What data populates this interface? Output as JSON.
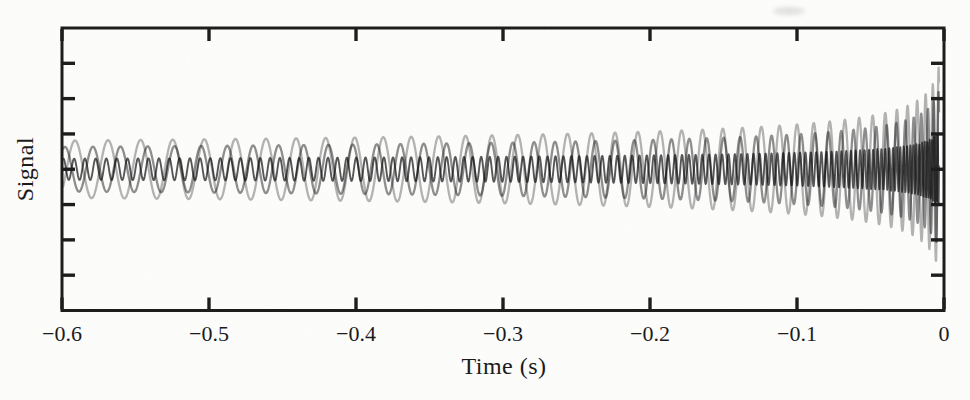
{
  "figure": {
    "background_color": "#fdfdfc",
    "axis_color": "#1a1a1a",
    "text_color": "#1b1b1b"
  },
  "chart_data": {
    "type": "line",
    "title": "",
    "xlabel": "Time (s)",
    "ylabel": "Signal",
    "xlim": [
      -0.6,
      0
    ],
    "x_ticks": [
      -0.6,
      -0.5,
      -0.4,
      -0.3,
      -0.2,
      -0.1,
      0
    ],
    "x_tick_labels": [
      "−0.6",
      "−0.5",
      "−0.4",
      "−0.3",
      "−0.2",
      "−0.1",
      "0"
    ],
    "y_tick_count": 7,
    "y_tick_labels": [],
    "grid": false,
    "legend": false,
    "model": {
      "frequency_law": "f(tau) = f_ref * (tau / 0.5 s)^(-3/8), tau = time before coalescence",
      "amplitude_law": "a(tau) = a_ref * (tau / 0.5 s)^(-1/4)",
      "coalescence_time_s": 0,
      "tau_cutoff_s": 0.0032
    },
    "series": [
      {
        "name": "chirp-large-amplitude-low-frequency",
        "color": "#aeaeae",
        "f_ref_hz": 47,
        "amp_ref_rel": 1.0,
        "phase_rad": 0.0
      },
      {
        "name": "chirp-medium-amplitude-mid-frequency",
        "color": "#878787",
        "f_ref_hz": 56,
        "amp_ref_rel": 0.78,
        "phase_rad": 2.2
      },
      {
        "name": "chirp-small-amplitude-high-frequency",
        "color": "#4c4c4c",
        "f_ref_hz": 145,
        "amp_ref_rel": 0.37,
        "phase_rad": 0.8
      }
    ]
  }
}
